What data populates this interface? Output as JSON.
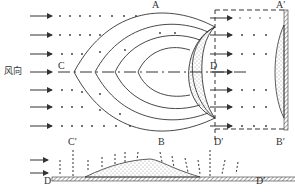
{
  "diagram": {
    "wind_direction_label": "风向",
    "labels": {
      "A": "A",
      "A_prime": "A′",
      "B": "B",
      "B_prime": "B′",
      "C": "C",
      "C_prime": "C′",
      "D": "D",
      "D_prime": "D′",
      "D_bottom": "D",
      "D_prime_bottom": "D′"
    },
    "colors": {
      "line": "#333333",
      "stipple": "#9a9a9a",
      "background": "#ffffff"
    }
  }
}
